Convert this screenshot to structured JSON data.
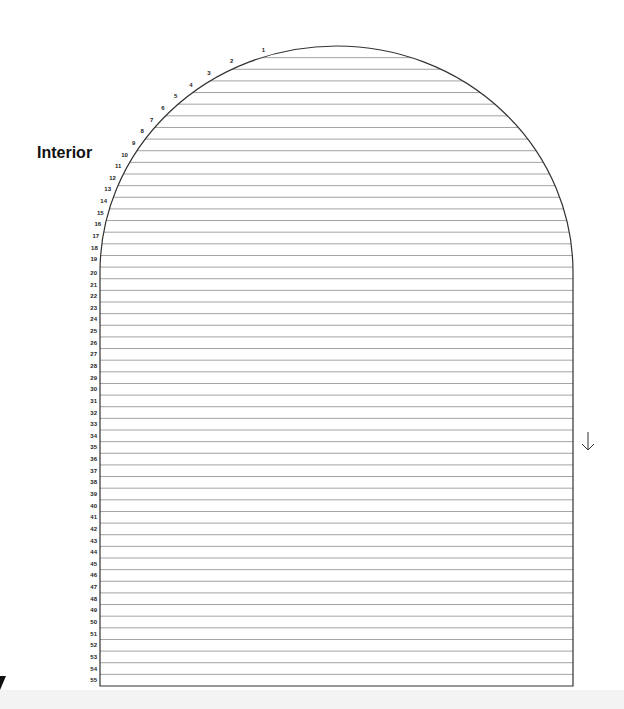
{
  "title": "Interior",
  "diagram": {
    "type": "arched-window-row-chart",
    "row_count": 55,
    "rows": [
      "1",
      "2",
      "3",
      "4",
      "5",
      "6",
      "7",
      "8",
      "9",
      "10",
      "11",
      "12",
      "13",
      "14",
      "15",
      "16",
      "17",
      "18",
      "19",
      "20",
      "21",
      "22",
      "23",
      "24",
      "25",
      "26",
      "27",
      "28",
      "29",
      "30",
      "31",
      "32",
      "33",
      "34",
      "35",
      "36",
      "37",
      "38",
      "39",
      "40",
      "41",
      "42",
      "43",
      "44",
      "45",
      "46",
      "47",
      "48",
      "49",
      "50",
      "51",
      "52",
      "53",
      "54",
      "55"
    ],
    "arrow": "down-arrow",
    "colors": {
      "outline": "#333333",
      "row_line": "#8a8a8a",
      "label": "#222222"
    }
  }
}
